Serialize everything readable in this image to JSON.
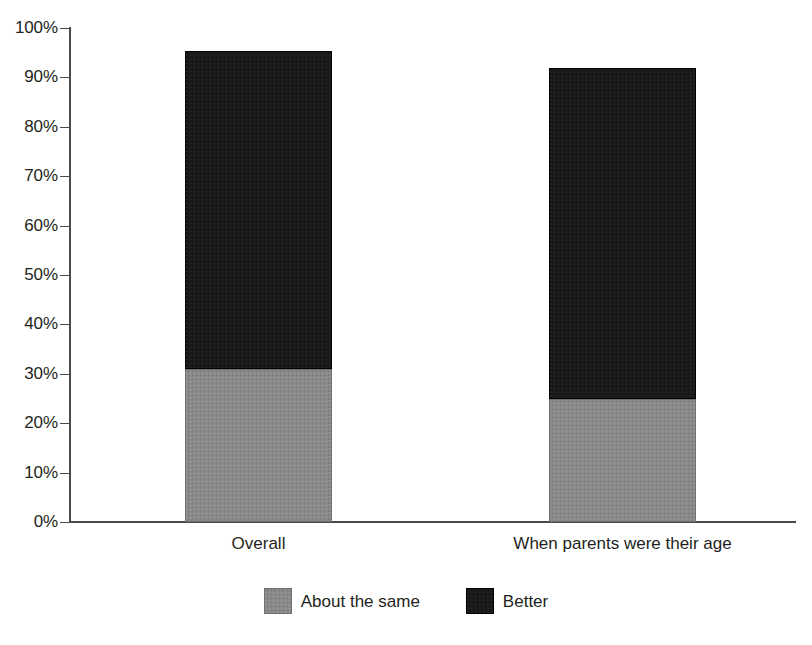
{
  "chart_data": {
    "type": "bar",
    "subtype": "stacked-bar",
    "title": "",
    "subtitle": "",
    "xlabel": "",
    "ylabel": "",
    "categories": [
      "Overall",
      "When parents were their age"
    ],
    "series": [
      {
        "name": "About the same",
        "color": "#8a8a8a",
        "values": [
          31.0,
          24.9
        ]
      },
      {
        "name": "Better",
        "color": "#181818",
        "values": [
          64.3,
          67.0
        ]
      }
    ],
    "totals": [
      95.3,
      91.9
    ],
    "ylim": [
      0,
      100
    ],
    "ytick_values": [
      0,
      10,
      20,
      30,
      40,
      50,
      60,
      70,
      80,
      90,
      100
    ],
    "ytick_labels": [
      "0%",
      "10%",
      "20%",
      "30%",
      "40%",
      "50%",
      "60%",
      "70%",
      "80%",
      "90%",
      "100%"
    ],
    "grid": false,
    "legend_position": "bottom-center",
    "legend_entries": [
      {
        "label": "About the same",
        "color": "#8a8a8a"
      },
      {
        "label": "Better",
        "color": "#181818"
      }
    ]
  },
  "axis": {
    "y_labels": [
      "100%",
      "90%",
      "80%",
      "70%",
      "60%",
      "50%",
      "40%",
      "30%",
      "20%",
      "10%",
      "0%"
    ],
    "x_labels": [
      "Overall",
      "When parents were their age"
    ]
  },
  "legend": {
    "items": [
      {
        "label": "About the same"
      },
      {
        "label": "Better"
      }
    ]
  },
  "colors": {
    "series_about_the_same": "#8a8a8a",
    "series_better": "#181818",
    "axis": "#4a4a4a",
    "text": "#231f20",
    "background": "#ffffff"
  }
}
